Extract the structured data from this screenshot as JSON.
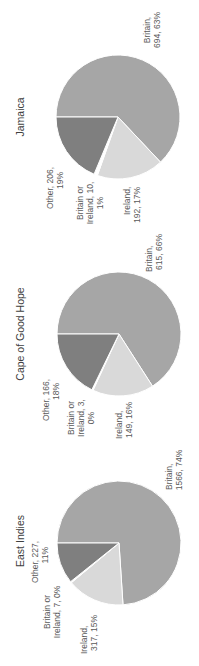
{
  "colors": {
    "Britain": "#a6a6a6",
    "Ireland": "#d9d9d9",
    "Britain or Ireland": "#ffffff",
    "Other": "#7f7f7f",
    "edge": "#ffffff",
    "label": "#595959",
    "title": "#404040"
  },
  "chart_data": [
    {
      "type": "pie",
      "title": "East Indies",
      "categories": [
        "Britain",
        "Ireland",
        "Britain or Ireland",
        "Other"
      ],
      "values": [
        1566,
        317,
        7,
        227
      ],
      "percent_labels": [
        "74%",
        "15%",
        "0%",
        "11%"
      ],
      "data_labels": [
        "Britain, 1566, 74%",
        "Ireland, 317, 15%",
        "Britain or Ireland, 7, 0%",
        "Other, 227, 11%"
      ]
    },
    {
      "type": "pie",
      "title": "Cape of Good Hope",
      "categories": [
        "Britain",
        "Ireland",
        "Britain or Ireland",
        "Other"
      ],
      "values": [
        615,
        149,
        3,
        166
      ],
      "percent_labels": [
        "66%",
        "16%",
        "0%",
        "18%"
      ],
      "data_labels": [
        "Britain, 615, 66%",
        "Ireland, 149, 16%",
        "Britain or Ireland, 3, 0%",
        "Other, 166, 18%"
      ]
    },
    {
      "type": "pie",
      "title": "Jamaica",
      "categories": [
        "Britain",
        "Ireland",
        "Britain or Ireland",
        "Other"
      ],
      "values": [
        694,
        192,
        10,
        206
      ],
      "percent_labels": [
        "63%",
        "17%",
        "1%",
        "19%"
      ],
      "data_labels": [
        "Britain, 694, 63%",
        "Ireland, 192, 17%",
        "Britain or Ireland, 10, 1%",
        "Other, 206, 19%"
      ]
    }
  ],
  "labels": {
    "east_indies": {
      "title": "East Indies",
      "britain": [
        "Britain,",
        "1566, 74%"
      ],
      "ireland": [
        "Ireland,",
        "317, 15%"
      ],
      "bori": [
        "Britain or",
        "Ireland, 7, 0%"
      ],
      "other": [
        "Other, 227,",
        "11%"
      ]
    },
    "cape": {
      "title": "Cape of Good Hope",
      "britain": [
        "Britain,",
        "615, 66%"
      ],
      "ireland": [
        "Ireland,",
        "149, 16%"
      ],
      "bori": [
        "Britain or",
        "Ireland, 3,",
        "0%"
      ],
      "other": [
        "Other, 166,",
        "18%"
      ]
    },
    "jamaica": {
      "title": "Jamaica",
      "britain": [
        "Britain,",
        "694, 63%"
      ],
      "ireland": [
        "Ireland,",
        "192, 17%"
      ],
      "bori": [
        "Britain or",
        "Ireland, 10,",
        "1%"
      ],
      "other": [
        "Other, 206,",
        "19%"
      ]
    }
  }
}
